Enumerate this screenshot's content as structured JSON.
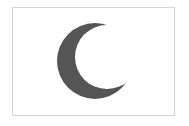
{
  "figure": {
    "type": "crescent-emblem",
    "background": "#ffffff",
    "border_color": "#d4d4d4",
    "crescent_color": "#555555",
    "icon": "crescent-moon-icon"
  }
}
